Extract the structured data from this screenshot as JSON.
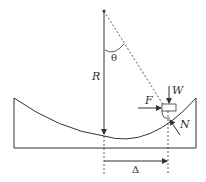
{
  "diagram": {
    "labels": {
      "radius": "R",
      "angle": "θ",
      "weight": "W",
      "friction": "F",
      "normal": "N",
      "displacement": "Δ"
    },
    "colors": {
      "stroke": "#333333",
      "background": "#ffffff"
    }
  }
}
